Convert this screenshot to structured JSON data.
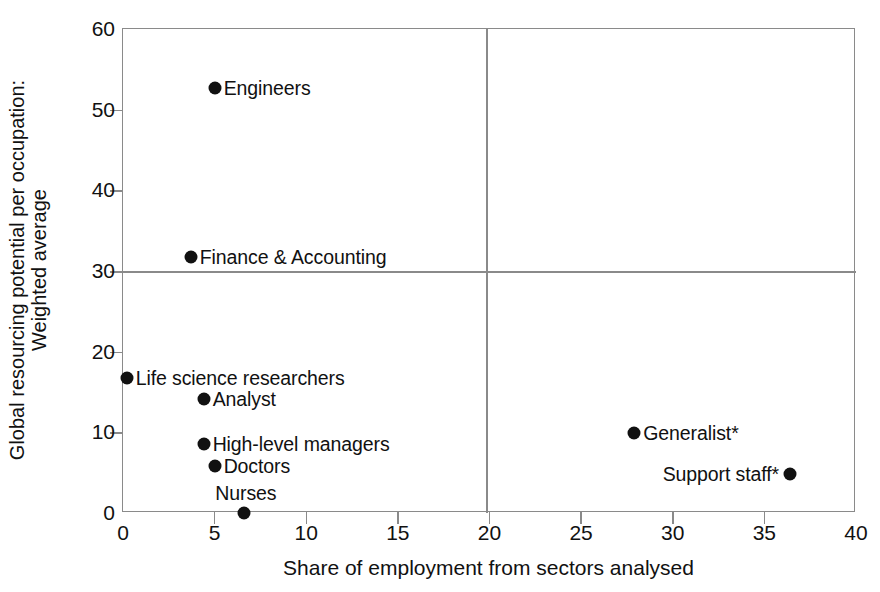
{
  "caption_remnant": "",
  "chart_data": {
    "type": "scatter",
    "title": "",
    "xlabel": "Share of employment from sectors analysed",
    "ylabel_lines": [
      "Global resourcing potential per occupation:",
      "Weighted average"
    ],
    "xlim": [
      0,
      40
    ],
    "ylim": [
      0,
      60
    ],
    "xticks": [
      0,
      5,
      10,
      15,
      20,
      25,
      30,
      35,
      40
    ],
    "yticks": [
      0,
      10,
      20,
      30,
      40,
      50,
      60
    ],
    "xtick_labels": [
      "0",
      "5",
      "10",
      "15",
      "20",
      "25",
      "30",
      "35",
      "40"
    ],
    "ytick_labels": [
      "0",
      "10",
      "20",
      "30",
      "40",
      "50",
      "60"
    ],
    "grid": false,
    "legend": "none",
    "quadrant_lines": {
      "x": 20,
      "y": 30
    },
    "marker_color": "#111111",
    "frame_color": "#8a8a8a",
    "points": [
      {
        "label": "Engineers",
        "x": 5.0,
        "y": 52.7,
        "label_side": "right"
      },
      {
        "label": "Finance & Accounting",
        "x": 3.7,
        "y": 31.7,
        "label_side": "right"
      },
      {
        "label": "Life science researchers",
        "x": 0.2,
        "y": 16.7,
        "label_side": "right"
      },
      {
        "label": "Analyst",
        "x": 4.4,
        "y": 14.1,
        "label_side": "right"
      },
      {
        "label": "High-level managers",
        "x": 4.4,
        "y": 8.5,
        "label_side": "right"
      },
      {
        "label": "Doctors",
        "x": 5.0,
        "y": 5.8,
        "label_side": "right"
      },
      {
        "label": "Nurses",
        "x": 6.6,
        "y": 0.0,
        "label_side": "above"
      },
      {
        "label": "Generalist*",
        "x": 27.9,
        "y": 9.9,
        "label_side": "right"
      },
      {
        "label": "Support staff*",
        "x": 36.4,
        "y": 4.8,
        "label_side": "left"
      }
    ]
  }
}
